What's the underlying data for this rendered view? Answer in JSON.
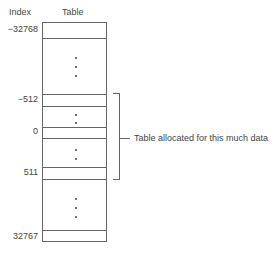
{
  "diagram": {
    "headers": {
      "index": "Index",
      "table": "Table"
    },
    "index_labels": [
      {
        "text": "−32768"
      },
      {
        "text": "−512"
      },
      {
        "text": "0"
      },
      {
        "text": "511"
      },
      {
        "text": "32767"
      }
    ],
    "annotation": "Table allocated for this much data",
    "colors": {
      "line": "#666666",
      "text": "#444444",
      "background": "#ffffff"
    }
  }
}
